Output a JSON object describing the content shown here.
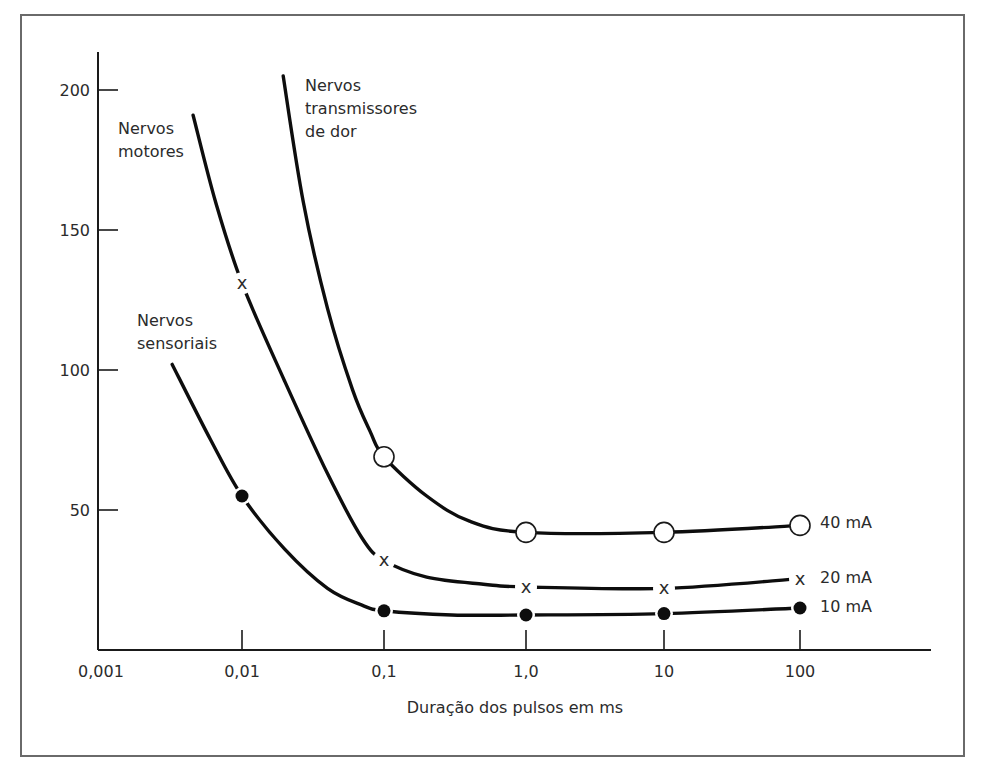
{
  "chart_data": {
    "type": "line",
    "title": "",
    "xlabel": "Duração dos pulsos em ms",
    "ylabel": "",
    "x_scale": "log",
    "x_ticks": [
      "0,001",
      "0,01",
      "0,1",
      "1,0",
      "10",
      "100"
    ],
    "x_tick_values": [
      0.001,
      0.01,
      0.1,
      1,
      10,
      100
    ],
    "y_ticks": [
      "50",
      "100",
      "150",
      "200"
    ],
    "y_tick_values": [
      50,
      100,
      150,
      200
    ],
    "ylim": [
      0,
      210
    ],
    "xlim": [
      0.001,
      1000
    ],
    "grid": false,
    "legend": "inline labels at curve ends",
    "curve_labels": [
      {
        "id": "pain",
        "lines": [
          "Nervos",
          "transmissores",
          "de dor"
        ]
      },
      {
        "id": "motor",
        "lines": [
          "Nervos",
          "motores"
        ]
      },
      {
        "id": "sensory",
        "lines": [
          "Nervos",
          "sensoriais"
        ]
      }
    ],
    "series": [
      {
        "id": "pain",
        "name": "Nervos transmissores de dor",
        "end_label": "40 mA",
        "marker": "open-circle",
        "curve": [
          [
            0.0195,
            205
          ],
          [
            0.027,
            160
          ],
          [
            0.04,
            122
          ],
          [
            0.06,
            93
          ],
          [
            0.08,
            78
          ],
          [
            0.1,
            69
          ],
          [
            0.2,
            55
          ],
          [
            0.4,
            46
          ],
          [
            1,
            42
          ],
          [
            10,
            42
          ],
          [
            100,
            44.5
          ]
        ],
        "points": [
          [
            0.1,
            69
          ],
          [
            1,
            42
          ],
          [
            10,
            42
          ],
          [
            100,
            44.5
          ]
        ]
      },
      {
        "id": "motor",
        "name": "Nervos motores",
        "end_label": "20 mA",
        "marker": "x",
        "curve": [
          [
            0.0045,
            191
          ],
          [
            0.0065,
            160
          ],
          [
            0.01,
            131
          ],
          [
            0.02,
            96
          ],
          [
            0.04,
            63
          ],
          [
            0.07,
            40
          ],
          [
            0.1,
            32
          ],
          [
            0.2,
            26
          ],
          [
            0.5,
            23.5
          ],
          [
            1,
            22.5
          ],
          [
            10,
            22
          ],
          [
            100,
            25.5
          ]
        ],
        "points": [
          [
            0.01,
            131
          ],
          [
            0.1,
            32
          ],
          [
            1,
            22.5
          ],
          [
            10,
            22
          ],
          [
            100,
            25.5
          ]
        ]
      },
      {
        "id": "sensory",
        "name": "Nervos sensoriais",
        "end_label": "10 mA",
        "marker": "filled-circle",
        "curve": [
          [
            0.0032,
            102
          ],
          [
            0.006,
            75
          ],
          [
            0.01,
            55
          ],
          [
            0.02,
            36
          ],
          [
            0.04,
            22
          ],
          [
            0.07,
            16
          ],
          [
            0.1,
            14
          ],
          [
            0.3,
            12.5
          ],
          [
            1,
            12.5
          ],
          [
            10,
            13
          ],
          [
            100,
            15
          ]
        ],
        "points": [
          [
            0.01,
            55
          ],
          [
            0.1,
            14
          ],
          [
            1,
            12.5
          ],
          [
            10,
            13
          ],
          [
            100,
            15
          ]
        ]
      }
    ],
    "colors": {
      "curve": "#0d0d0d",
      "text": "#2b2b2b",
      "frame": "#6a6a6a",
      "background": "#ffffff"
    }
  }
}
